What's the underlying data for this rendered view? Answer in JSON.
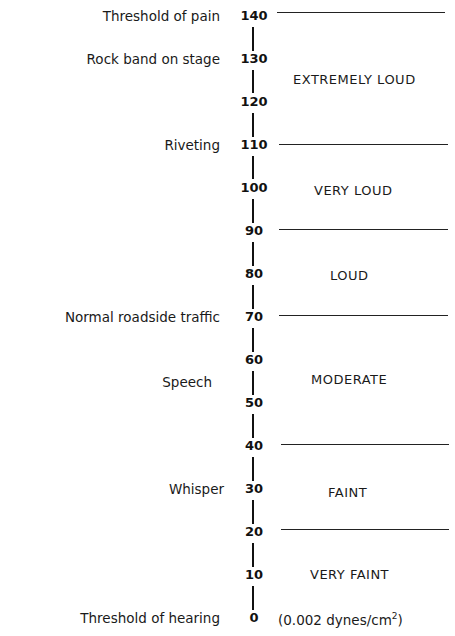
{
  "diagram": {
    "type": "decibel-scale",
    "axis": {
      "ticks": [
        "140",
        "130",
        "120",
        "110",
        "100",
        "90",
        "80",
        "70",
        "60",
        "50",
        "40",
        "30",
        "20",
        "10",
        "0"
      ]
    },
    "examples": [
      {
        "label": "Threshold of pain",
        "db": 140
      },
      {
        "label": "Rock band on stage",
        "db": 130
      },
      {
        "label": "Riveting",
        "db": 110
      },
      {
        "label": "Normal roadside traffic",
        "db": 70
      },
      {
        "label": "Speech",
        "db": 55
      },
      {
        "label": "Whisper",
        "db": 30
      },
      {
        "label": "Threshold of hearing",
        "db": 0
      }
    ],
    "zones": [
      {
        "label": "EXTREMELY LOUD",
        "from": 110,
        "to": 140
      },
      {
        "label": "VERY LOUD",
        "from": 90,
        "to": 110
      },
      {
        "label": "LOUD",
        "from": 70,
        "to": 90
      },
      {
        "label": "MODERATE",
        "from": 40,
        "to": 70
      },
      {
        "label": "FAINT",
        "from": 20,
        "to": 40
      },
      {
        "label": "VERY FAINT",
        "from": 0,
        "to": 20
      }
    ],
    "separators_db": [
      140,
      110,
      90,
      70,
      40,
      20
    ],
    "reference_note": {
      "prefix": "(0.002 dynes/cm",
      "superscript": "2",
      "suffix": ")"
    }
  }
}
